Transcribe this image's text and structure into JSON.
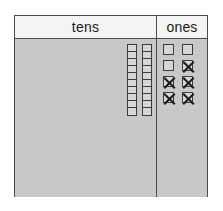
{
  "chart": {
    "type": "place-value-chart",
    "columns": [
      {
        "key": "tens",
        "label": "tens"
      },
      {
        "key": "ones",
        "label": "ones"
      }
    ],
    "tens": {
      "label": "tens",
      "rod_count": 2,
      "units_per_rod": 10,
      "total_units": 20,
      "rods": [
        {
          "units": 10,
          "crossed": 0
        },
        {
          "units": 10,
          "crossed": 0
        }
      ]
    },
    "ones": {
      "label": "ones",
      "square_count": 8,
      "crossed_count": 5,
      "remaining_count": 3,
      "grid_columns": 2,
      "grid_rows": 4,
      "squares": [
        {
          "index": 1,
          "crossed": false
        },
        {
          "index": 2,
          "crossed": false
        },
        {
          "index": 3,
          "crossed": false
        },
        {
          "index": 4,
          "crossed": true
        },
        {
          "index": 5,
          "crossed": true
        },
        {
          "index": 6,
          "crossed": true
        },
        {
          "index": 7,
          "crossed": true
        },
        {
          "index": 8,
          "crossed": true
        }
      ]
    }
  },
  "colors": {
    "border": "#4a4a4a",
    "header_background": "#f4f4f4",
    "body_background": "#c8c8c8",
    "block_fill": "#d6d6d6",
    "block_outline": "#3c3c3c",
    "cross_mark": "#1a1a1a",
    "page_background": "#ffffff"
  }
}
